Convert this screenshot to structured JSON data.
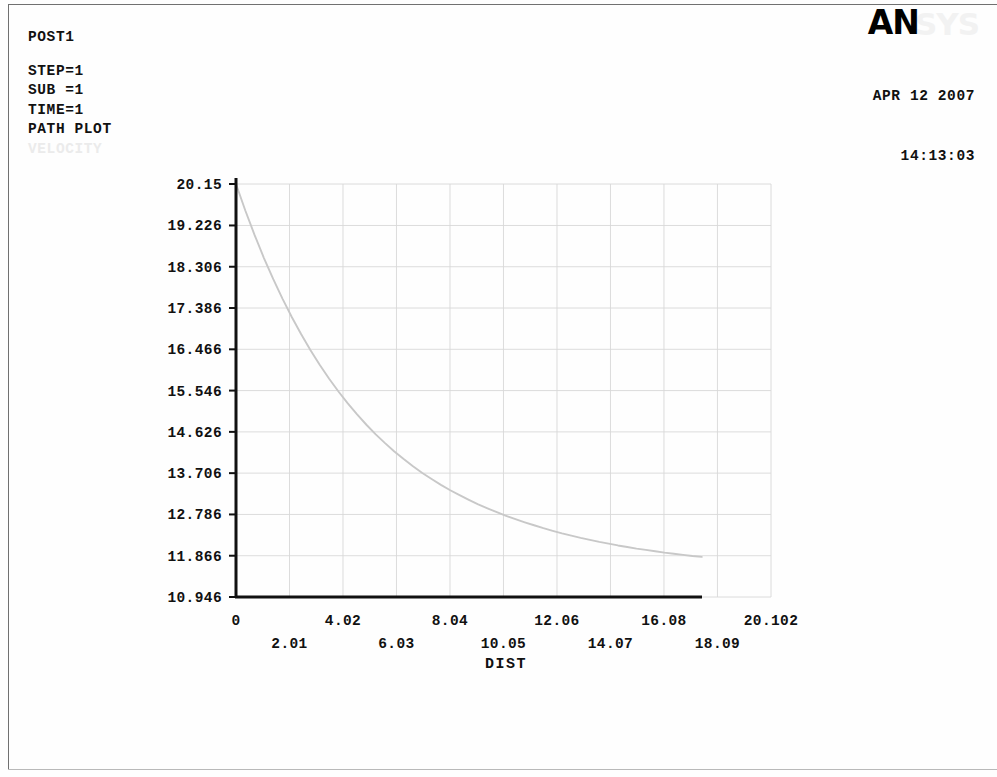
{
  "header": {
    "title": "POST1",
    "lines": [
      "STEP=1",
      "SUB =1",
      "TIME=1",
      "PATH PLOT"
    ],
    "faded_label": "VELOCITY"
  },
  "branding": {
    "logo_primary": "AN",
    "logo_ghost": "SYS",
    "date": "APR 12 2007",
    "time": "14:13:03"
  },
  "colors": {
    "axis": "#111111",
    "grid": "#d8d8d8",
    "curve": "#c8c8c8",
    "text": "#111111",
    "faded_text": "#ebebeb"
  },
  "chart_data": {
    "type": "line",
    "title": "",
    "xlabel": "DIST",
    "ylabel": "",
    "xlim": [
      0,
      20.102
    ],
    "ylim": [
      10.946,
      20.15
    ],
    "grid": true,
    "legend": "none",
    "xticks": [
      0,
      2.01,
      4.02,
      6.03,
      8.04,
      10.05,
      12.06,
      14.07,
      16.08,
      18.09,
      20.102
    ],
    "xtick_labels": [
      "0",
      "2.01",
      "4.02",
      "6.03",
      "8.04",
      "10.05",
      "12.06",
      "14.07",
      "16.08",
      "18.09",
      "20.102"
    ],
    "yticks": [
      10.946,
      11.866,
      12.786,
      13.706,
      14.626,
      15.546,
      16.466,
      17.386,
      18.306,
      19.226,
      20.15
    ],
    "ytick_labels": [
      "10.946",
      "11.866",
      "12.786",
      "13.706",
      "14.626",
      "15.546",
      "16.466",
      "17.386",
      "18.306",
      "19.226",
      "20.15"
    ],
    "series": [
      {
        "name": "VELOCITY",
        "x": [
          0.0,
          0.35,
          0.7,
          1.05,
          1.4,
          1.75,
          2.1,
          2.45,
          2.8,
          3.15,
          3.5,
          3.85,
          4.2,
          4.55,
          4.9,
          5.25,
          5.6,
          5.95,
          6.3,
          6.65,
          7.0,
          7.35,
          7.7,
          8.05,
          8.4,
          8.75,
          9.1,
          9.45,
          9.8,
          10.15,
          10.5,
          10.85,
          11.2,
          11.55,
          11.9,
          12.25,
          12.6,
          12.95,
          13.3,
          13.65,
          14.0,
          14.35,
          14.7,
          15.05,
          15.4,
          15.75,
          16.1,
          16.45,
          16.8,
          17.15,
          17.5
        ],
        "y": [
          20.15,
          19.56,
          19.01,
          18.5,
          18.03,
          17.59,
          17.18,
          16.8,
          16.445,
          16.115,
          15.81,
          15.525,
          15.26,
          15.015,
          14.785,
          14.57,
          14.375,
          14.19,
          14.02,
          13.86,
          13.71,
          13.575,
          13.445,
          13.325,
          13.215,
          13.11,
          13.01,
          12.92,
          12.835,
          12.755,
          12.68,
          12.61,
          12.545,
          12.48,
          12.42,
          12.365,
          12.315,
          12.265,
          12.22,
          12.175,
          12.135,
          12.095,
          12.06,
          12.025,
          11.995,
          11.965,
          11.935,
          11.91,
          11.885,
          11.86,
          11.84
        ]
      }
    ]
  }
}
